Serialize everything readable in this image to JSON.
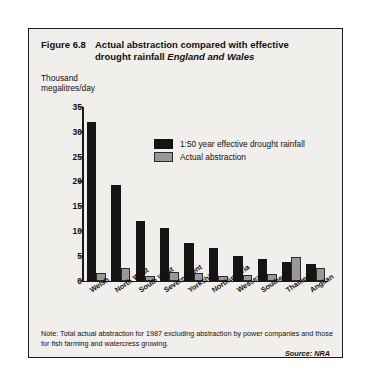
{
  "figure": {
    "number": "Figure 6.8",
    "title_line1": "Actual abstraction compared with effective",
    "title_line2": "drought rainfall",
    "title_region": "England and Wales",
    "note": "Note:  Total actual abstraction for 1987 excluding abstraction by power companies and those for fish farming and watercress growing.",
    "source": "Source:  NRA"
  },
  "colors": {
    "series_drought": "#141414",
    "series_abstraction": "#989897",
    "panel_background": "#f0efec",
    "frame_border": "#1b1b1b",
    "text": "#111111"
  },
  "chart_data": {
    "type": "bar",
    "title": "Actual abstraction compared with effective drought rainfall England and Wales",
    "xlabel": "",
    "ylabel": "Thousand megalitres/day",
    "ylabel_line1": "Thousand",
    "ylabel_line2": "megalitres/day",
    "ylim": [
      0,
      35
    ],
    "yticks": [
      0,
      5,
      10,
      15,
      20,
      25,
      30,
      35
    ],
    "ytick_labels": [
      "0",
      "5",
      "10",
      "15",
      "20",
      "25",
      "30",
      "35"
    ],
    "grid": false,
    "legend_position": "upper-center",
    "categories": [
      "Welsh",
      "North West",
      "South West",
      "Severn Trent",
      "Yorkshire",
      "Northumbria",
      "Wessex",
      "Southern",
      "Thames",
      "Anglian"
    ],
    "series": [
      {
        "name": "1:50 year effective drought rainfall",
        "color": "#141414",
        "values": [
          32.0,
          19.2,
          12.0,
          10.5,
          7.5,
          6.6,
          5.0,
          4.4,
          3.8,
          3.4
        ]
      },
      {
        "name": "Actual abstraction",
        "color": "#989897",
        "values": [
          1.5,
          2.6,
          1.0,
          1.8,
          1.6,
          1.0,
          1.1,
          1.3,
          4.8,
          2.5
        ]
      }
    ]
  }
}
